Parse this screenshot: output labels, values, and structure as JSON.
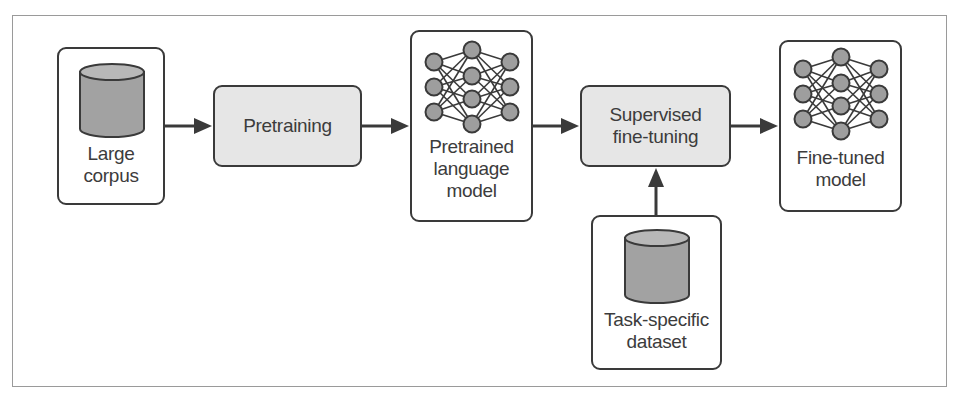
{
  "diagram": {
    "type": "flowchart",
    "title": "",
    "nodes": [
      {
        "id": "large-corpus",
        "kind": "data",
        "icon": "database-cylinder-icon",
        "lines": [
          "Large",
          "corpus"
        ]
      },
      {
        "id": "pretraining",
        "kind": "process",
        "lines": [
          "Pretraining"
        ]
      },
      {
        "id": "pretrained-lm",
        "kind": "model",
        "icon": "neural-network-icon",
        "lines": [
          "Pretrained",
          "language",
          "model"
        ]
      },
      {
        "id": "supervised-ft",
        "kind": "process",
        "lines": [
          "Supervised",
          "fine-tuning"
        ]
      },
      {
        "id": "fine-tuned-model",
        "kind": "model",
        "icon": "neural-network-icon",
        "lines": [
          "Fine-tuned",
          "model"
        ]
      },
      {
        "id": "task-dataset",
        "kind": "data",
        "icon": "database-cylinder-icon",
        "lines": [
          "Task-specific",
          "dataset"
        ]
      }
    ],
    "edges": [
      {
        "from": "large-corpus",
        "to": "pretraining"
      },
      {
        "from": "pretraining",
        "to": "pretrained-lm"
      },
      {
        "from": "pretrained-lm",
        "to": "supervised-ft"
      },
      {
        "from": "supervised-ft",
        "to": "fine-tuned-model"
      },
      {
        "from": "task-dataset",
        "to": "supervised-ft"
      }
    ]
  },
  "colors": {
    "border": "#3a3a3a",
    "process_fill": "#e6e6e6",
    "node_fill": "#9e9e9e",
    "cylinder_top": "#b8b8b8",
    "cylinder_body": "#a2a2a2",
    "text": "#3c3c3c",
    "frame": "#9a9a9a"
  }
}
